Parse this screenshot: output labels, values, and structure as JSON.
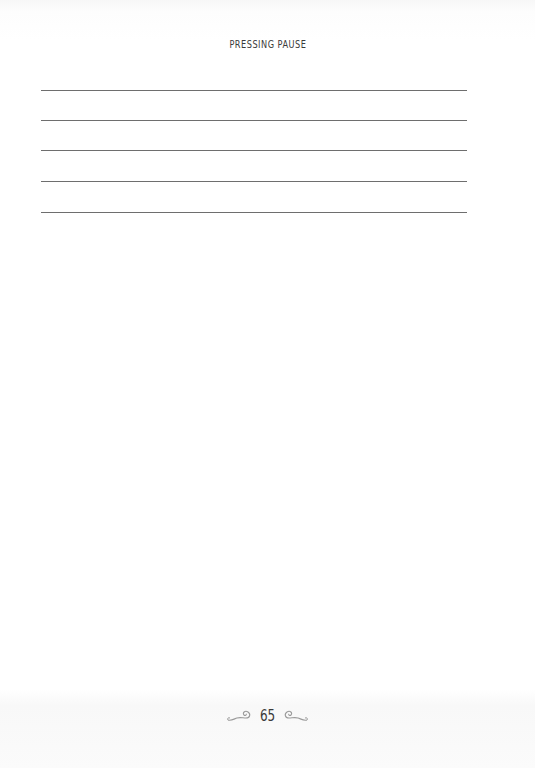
{
  "header": {
    "running_head": "PRESSING PAUSE"
  },
  "writing_lines": {
    "count": 5,
    "positions_y": [
      90,
      120,
      150,
      181,
      212
    ]
  },
  "footer": {
    "page_number": "65",
    "ornament_left": "scroll-flourish-left-icon",
    "ornament_right": "scroll-flourish-right-icon"
  },
  "colors": {
    "text": "#3a3a3a",
    "rule": "#6e6e6e",
    "ornament": "#9a9a9a",
    "paper": "#ffffff"
  }
}
